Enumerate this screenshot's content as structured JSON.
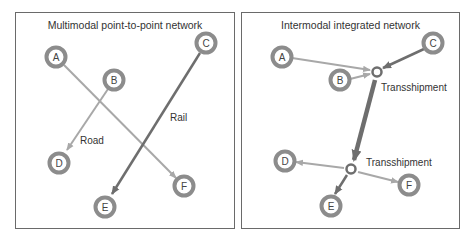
{
  "colors": {
    "node_ring": "#8c8c8c",
    "road_edge": "#a8a8a8",
    "rail_edge": "#6e6e6e",
    "trunk_edge": "#6e6e6e",
    "panel_border": "#6a6a6a",
    "text": "#333333"
  },
  "left_panel": {
    "title": "Multimodal point-to-point network",
    "nodes": [
      {
        "id": "A",
        "label": "A"
      },
      {
        "id": "B",
        "label": "B"
      },
      {
        "id": "C",
        "label": "C"
      },
      {
        "id": "D",
        "label": "D"
      },
      {
        "id": "E",
        "label": "E"
      },
      {
        "id": "F",
        "label": "F"
      }
    ],
    "edges": [
      {
        "from": "A",
        "to": "F",
        "mode": "road"
      },
      {
        "from": "B",
        "to": "D",
        "mode": "road"
      },
      {
        "from": "C",
        "to": "E",
        "mode": "rail"
      }
    ],
    "edge_labels": {
      "road": "Road",
      "rail": "Rail"
    }
  },
  "right_panel": {
    "title": "Intermodal integrated network",
    "nodes": [
      {
        "id": "A",
        "label": "A"
      },
      {
        "id": "B",
        "label": "B"
      },
      {
        "id": "C",
        "label": "C"
      },
      {
        "id": "D",
        "label": "D"
      },
      {
        "id": "E",
        "label": "E"
      },
      {
        "id": "F",
        "label": "F"
      }
    ],
    "hubs": [
      {
        "id": "T1",
        "label": "Transshipment"
      },
      {
        "id": "T2",
        "label": "Transshipment"
      }
    ],
    "edges": [
      {
        "from": "A",
        "to": "T1"
      },
      {
        "from": "B",
        "to": "T1"
      },
      {
        "from": "C",
        "to": "T1"
      },
      {
        "from": "T1",
        "to": "T2",
        "mode": "trunk"
      },
      {
        "from": "T2",
        "to": "D"
      },
      {
        "from": "T2",
        "to": "E"
      },
      {
        "from": "T2",
        "to": "F"
      }
    ]
  }
}
